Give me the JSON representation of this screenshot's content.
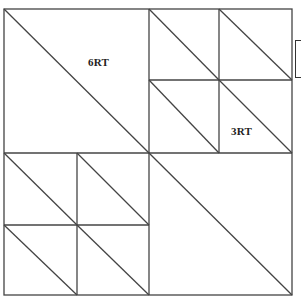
{
  "diagram": {
    "type": "quilt-block-layout",
    "stroke_color": "#444444",
    "background": "#ffffff",
    "outer_square": {
      "x1": 4,
      "y1": 9,
      "x2": 292,
      "y2": 295
    },
    "center": {
      "x": 149,
      "y": 153
    },
    "quadrants": [
      {
        "name": "top-left",
        "kind": "large-right-triangle-square",
        "label": "6RT"
      },
      {
        "name": "top-right",
        "kind": "2x2-right-triangle-grid",
        "label": "3RT"
      },
      {
        "name": "bottom-left",
        "kind": "2x2-right-triangle-grid",
        "label": ""
      },
      {
        "name": "bottom-right",
        "kind": "large-right-triangle-square",
        "label": ""
      }
    ],
    "labels": {
      "large": "6RT",
      "small": "3RT"
    },
    "partial_box": {
      "x": 295,
      "y": 40,
      "width": 8,
      "height": 36
    }
  }
}
